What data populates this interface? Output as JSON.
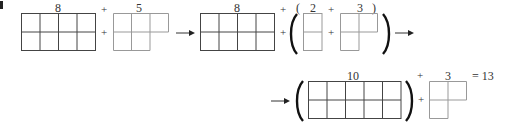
{
  "diagram": {
    "colors": {
      "dark_grid": "#444444",
      "light_grid": "#999999",
      "text": "#333333"
    },
    "row1": {
      "term1_label": "8",
      "plus1": "+",
      "term2_label": "5",
      "term3_label": "8",
      "plus2": "+",
      "open_paren_small": "(",
      "term4_label": "2",
      "plus3": "+",
      "term5_label": "3",
      "close_paren_small": ")"
    },
    "row2": {
      "term1_label": "10",
      "plus": "+",
      "term2_label": "3",
      "result": "= 13"
    },
    "shapes": [
      {
        "id": "grid-8-a",
        "cells": 8,
        "layout": "2x4",
        "color": "dark"
      },
      {
        "id": "shape-5",
        "cells": 5,
        "layout": "3 top + 2 bottom",
        "color": "light"
      },
      {
        "id": "grid-8-b",
        "cells": 8,
        "layout": "2x4",
        "color": "dark"
      },
      {
        "id": "shape-2",
        "cells": 2,
        "layout": "1x2 vertical",
        "color": "light"
      },
      {
        "id": "shape-3-a",
        "cells": 3,
        "layout": "L: 2 top + 1 bottom",
        "color": "light"
      },
      {
        "id": "grid-10",
        "cells": 10,
        "layout": "2x5",
        "color": "dark"
      },
      {
        "id": "shape-3-b",
        "cells": 3,
        "layout": "L: 2 top + 1 bottom",
        "color": "light"
      }
    ]
  }
}
